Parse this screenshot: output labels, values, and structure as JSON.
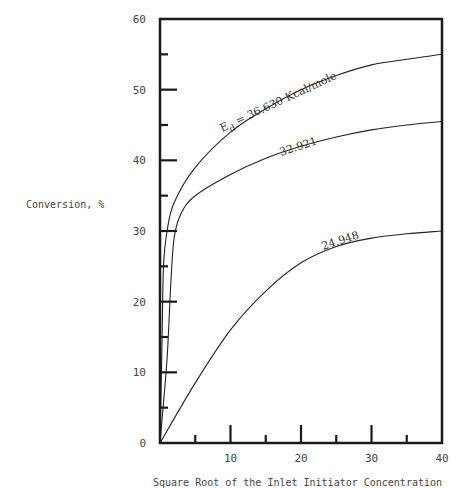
{
  "chart_data": {
    "type": "line",
    "title": "",
    "xlabel": "Square Root of the Inlet Initiator Concentration",
    "ylabel": "Conversion, %",
    "xlim": [
      0,
      40
    ],
    "ylim": [
      0,
      60
    ],
    "grid": false,
    "legend": "none (curves labeled inline)",
    "x_ticks": [
      10,
      20,
      30,
      40
    ],
    "x_tick_labels": [
      "10",
      "20",
      "30",
      "40"
    ],
    "x_minor_ticks": [
      5,
      15,
      25,
      35
    ],
    "y_ticks": [
      0,
      10,
      20,
      30,
      40,
      50,
      60
    ],
    "y_tick_labels": [
      "0",
      "10",
      "20",
      "30",
      "40",
      "50",
      "60"
    ],
    "y_minor_ticks": [
      5,
      15,
      25,
      35,
      45,
      55
    ],
    "series": [
      {
        "name": "Ed = 36.630 Kcal/mole",
        "label": "36.630 Kcal/mole",
        "x": [
          0,
          0.3,
          0.5,
          1,
          2,
          5,
          10,
          15,
          20,
          25,
          30,
          35,
          40
        ],
        "y": [
          0,
          15,
          25,
          30,
          34,
          39,
          44,
          47.3,
          50,
          52,
          53.5,
          54.3,
          55
        ]
      },
      {
        "name": "32.921",
        "label": "32.921",
        "x": [
          0,
          1,
          1.5,
          2,
          3,
          5,
          10,
          15,
          20,
          25,
          30,
          35,
          40
        ],
        "y": [
          0,
          12,
          22,
          29,
          32.5,
          35,
          38,
          40.3,
          42,
          43.3,
          44.3,
          45,
          45.5
        ]
      },
      {
        "name": "24.948",
        "label": "24.948",
        "x": [
          0,
          5,
          10,
          15,
          20,
          25,
          30,
          35,
          40
        ],
        "y": [
          0,
          8.5,
          16,
          21.5,
          25.5,
          27.8,
          29,
          29.6,
          30
        ]
      }
    ],
    "annotations": [
      {
        "text": "E",
        "subscript": "d",
        "rest": " = 36.630 Kcal/mole",
        "attached_to": "Ed = 36.630 Kcal/mole"
      },
      {
        "text": "32.921",
        "attached_to": "32.921"
      },
      {
        "text": "24.948",
        "attached_to": "24.948"
      }
    ]
  },
  "labels": {
    "ylabel": "Conversion, %",
    "xlabel": "Square Root of the Inlet Initiator Concentration",
    "ed_symbol": "E",
    "ed_subscript": "d",
    "ed_rest": " = 36.630 Kcal/mole",
    "curve2": "32.921",
    "curve3": "24.948"
  },
  "colors": {
    "line": "#222222",
    "frame": "#1a1a1a",
    "text": "#444444",
    "background": "#ffffff"
  }
}
